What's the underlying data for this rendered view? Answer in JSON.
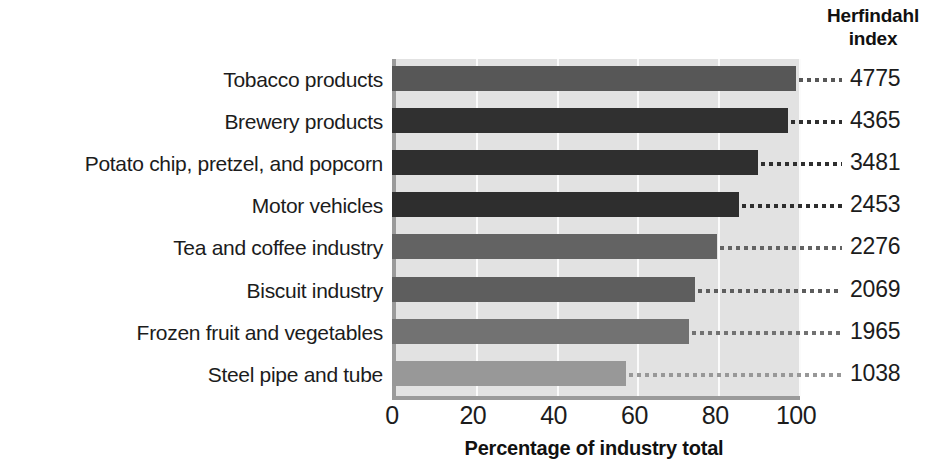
{
  "header": {
    "title_line1": "Herfindahl",
    "title_line2": "index"
  },
  "chart_data": {
    "type": "bar",
    "orientation": "horizontal",
    "title": "",
    "xlabel": "Percentage of industry total",
    "ylabel": "",
    "xlim": [
      0,
      100
    ],
    "xticks": [
      0,
      20,
      40,
      60,
      80,
      100
    ],
    "xtick_labels": [
      "0",
      "20",
      "40",
      "60",
      "80",
      "100"
    ],
    "grid": "vertical-white-gridlines",
    "legend": "none",
    "value_column_header": "Herfindahl index",
    "categories": [
      "Tobacco products",
      "Brewery products",
      "Potato chip, pretzel, and popcorn",
      "Motor vehicles",
      "Tea and coffee industry",
      "Biscuit industry",
      "Frozen fruit and vegetables",
      "Steel pipe and tube"
    ],
    "values": [
      100,
      98,
      90.5,
      86,
      80.5,
      75,
      73.5,
      58
    ],
    "herfindahl_index": [
      4775,
      4365,
      3481,
      2453,
      2276,
      2069,
      1965,
      1038
    ],
    "bar_colors": [
      "#575757",
      "#303030",
      "#2f2f2f",
      "#2e2e2e",
      "#636363",
      "#5e5e5e",
      "#727272",
      "#989898"
    ],
    "rows": [
      {
        "label": "Tobacco products",
        "percent": 100,
        "index": "4775",
        "color": "#575757"
      },
      {
        "label": "Brewery products",
        "percent": 98,
        "index": "4365",
        "color": "#303030"
      },
      {
        "label": "Potato chip, pretzel, and popcorn",
        "percent": 90.5,
        "index": "3481",
        "color": "#2f2f2f"
      },
      {
        "label": "Motor vehicles",
        "percent": 86,
        "index": "2453",
        "color": "#2e2e2e"
      },
      {
        "label": "Tea and coffee industry",
        "percent": 80.5,
        "index": "2276",
        "color": "#636363"
      },
      {
        "label": "Biscuit industry",
        "percent": 75,
        "index": "2069",
        "color": "#5e5e5e"
      },
      {
        "label": "Frozen fruit and vegetables",
        "percent": 73.5,
        "index": "1965",
        "color": "#727272"
      },
      {
        "label": "Steel pipe and tube",
        "percent": 58,
        "index": "1038",
        "color": "#989898"
      }
    ]
  },
  "colors": {
    "plot_background": "#e2e2e2",
    "axis_line": "#9a9a9a",
    "gridline": "#fbfbfb",
    "text": "#1c1c1c",
    "page_background": "#ffffff"
  }
}
